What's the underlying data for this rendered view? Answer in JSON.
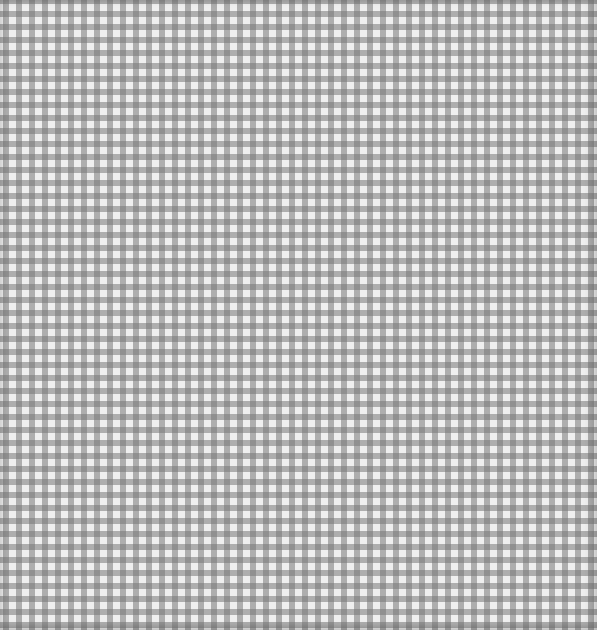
{
  "image": {
    "subject": "Grey and white gingham check fabric pattern",
    "colors": {
      "light": "#efefef",
      "band": "#8c8c8c",
      "intersection": "#7a7a7a"
    },
    "pattern_period_px": 13
  }
}
